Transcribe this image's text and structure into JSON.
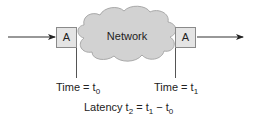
{
  "diagram": {
    "nodes": {
      "left_endpoint": {
        "label": "A"
      },
      "network": {
        "label": "Network"
      },
      "right_endpoint": {
        "label": "A"
      }
    },
    "timestamps": {
      "start": {
        "prefix": "Time = t",
        "subscript": "0"
      },
      "end": {
        "prefix": "Time = t",
        "subscript": "1"
      }
    },
    "formula": {
      "prefix": "Latency t",
      "sub_result": "2",
      "eq": " = t",
      "sub_a": "1",
      "minus": " − t",
      "sub_b": "0"
    },
    "colors": {
      "box_fill": "#e4e4e4",
      "box_stroke": "#8a8a8a",
      "cloud_fill": "#d2d2d2",
      "cloud_stroke": "#a9a9a9",
      "line": "#333333"
    }
  }
}
